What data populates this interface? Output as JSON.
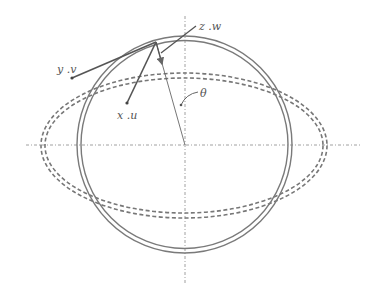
{
  "diagram": {
    "labels": {
      "zw": "z .w",
      "yv": "y .v",
      "xu": "x .u",
      "theta": "θ"
    },
    "colors": {
      "line": "#7a7a7a",
      "text": "#555555",
      "background": "#ffffff"
    },
    "geometry": {
      "center": [
        185,
        145
      ],
      "outer_circle_radius": 108,
      "inner_circle_radius": 103,
      "outer_dashed_ellipse": {
        "rx": 143,
        "ry": 72
      },
      "inner_dashed_ellipse": {
        "rx": 139,
        "ry": 67
      },
      "surface_point": [
        156,
        42
      ],
      "x_u_point": [
        127,
        103
      ],
      "y_v_point": [
        72,
        78
      ],
      "z_w_end": [
        196,
        26
      ]
    }
  }
}
